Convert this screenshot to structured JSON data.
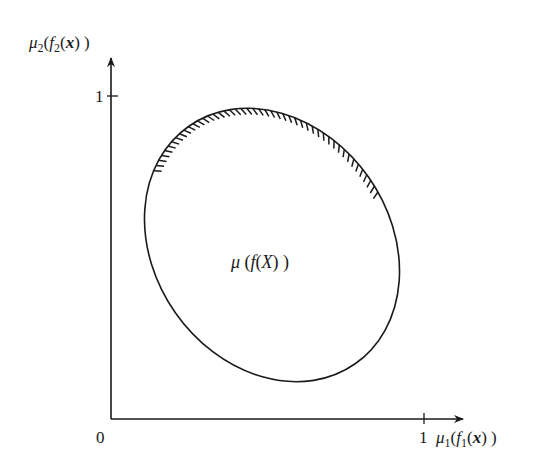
{
  "diagram": {
    "type": "membership-function objective space",
    "colors": {
      "stroke": "#1a1a1a",
      "background": "#ffffff"
    },
    "axes": {
      "origin_label": "0",
      "x_axis": {
        "label_main": "μ",
        "label_sub": "1",
        "label_inner_fn": "f",
        "label_inner_sub": "1",
        "label_var": "x",
        "full_label": "μ1(f1(x))",
        "tick_label": "1"
      },
      "y_axis": {
        "label_main": "μ",
        "label_sub": "2",
        "label_inner_fn": "f",
        "label_inner_sub": "2",
        "label_var": "x",
        "full_label": "μ2(f2(x))",
        "tick_label": "1"
      }
    },
    "region": {
      "label": "μ(f(X))",
      "label_mu": "μ",
      "label_f": "f",
      "label_X": "X",
      "shape": "tilted ellipse",
      "hatched_boundary": "upper-right arc (Pareto frontier)"
    }
  }
}
